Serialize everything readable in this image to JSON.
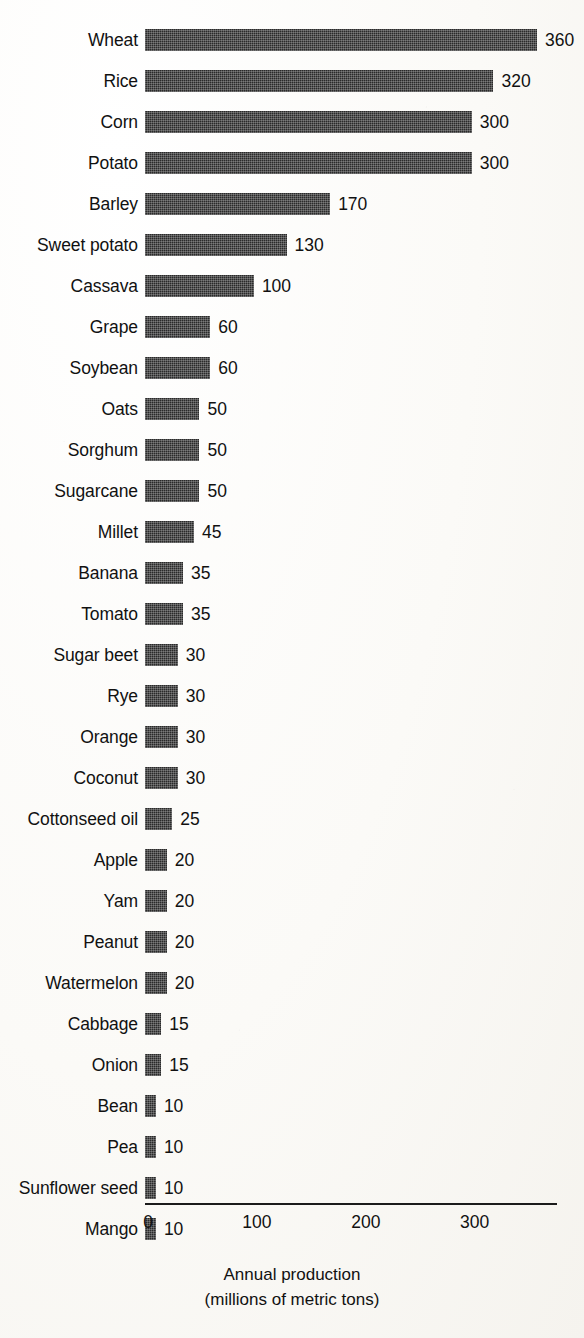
{
  "chart_data": {
    "type": "bar",
    "orientation": "horizontal",
    "title": "",
    "subtitle": "",
    "xlabel": "Annual production",
    "xlabel_line2": "(millions of metric tons)",
    "ylabel": "",
    "xlim": [
      0,
      360
    ],
    "xticks": [
      0,
      100,
      200,
      300
    ],
    "xtick_labels": [
      "0",
      "100",
      "200",
      "300"
    ],
    "grid": false,
    "legend": false,
    "value_labels_shown": true,
    "bar_color": "#2a2a2a",
    "background_color": "#fbfaf7",
    "axis_color": "#1b1b1b",
    "categories": [
      "Wheat",
      "Rice",
      "Corn",
      "Potato",
      "Barley",
      "Sweet potato",
      "Cassava",
      "Grape",
      "Soybean",
      "Oats",
      "Sorghum",
      "Sugarcane",
      "Millet",
      "Banana",
      "Tomato",
      "Sugar beet",
      "Rye",
      "Orange",
      "Coconut",
      "Cottonseed oil",
      "Apple",
      "Yam",
      "Peanut",
      "Watermelon",
      "Cabbage",
      "Onion",
      "Bean",
      "Pea",
      "Sunflower seed",
      "Mango"
    ],
    "values": [
      360,
      320,
      300,
      300,
      170,
      130,
      100,
      60,
      60,
      50,
      50,
      50,
      45,
      35,
      35,
      30,
      30,
      30,
      30,
      25,
      20,
      20,
      20,
      20,
      15,
      15,
      10,
      10,
      10,
      10
    ],
    "value_label_texts": [
      "360",
      "320",
      "300",
      "300",
      "170",
      "130",
      "100",
      "60",
      "60",
      "50",
      "50",
      "50",
      "45",
      "35",
      "35",
      "30",
      "30",
      "30",
      "30",
      "25",
      "20",
      "20",
      "20",
      "20",
      "15",
      "15",
      "10",
      "10",
      "10",
      "10"
    ]
  },
  "axis": {
    "caption_line1": "Annual production",
    "caption_line2": "(millions of metric tons)"
  }
}
